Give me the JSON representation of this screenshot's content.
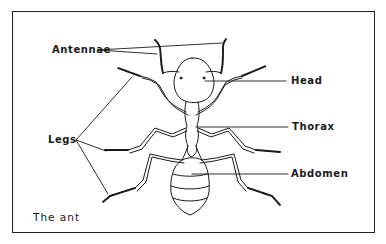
{
  "diagram": {
    "caption": "The ant",
    "labels": {
      "antennae": "Antennae",
      "head": "Head",
      "legs": "Legs",
      "thorax": "Thorax",
      "abdomen": "Abdomen"
    },
    "colors": {
      "ink": "#1a1a1a",
      "background": "#ffffff"
    }
  }
}
